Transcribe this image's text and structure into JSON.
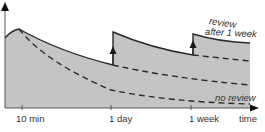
{
  "diagram": {
    "x_axis_label": "time",
    "tick_labels": [
      "10 min",
      "1 day",
      "1 week"
    ],
    "annotations": {
      "review_top_line1": "review",
      "review_top_line2": "after 1 week",
      "no_review": "no review"
    },
    "colors": {
      "fill": "#c4c4c4",
      "line": "#2a2a2a",
      "text": "#333333"
    }
  }
}
